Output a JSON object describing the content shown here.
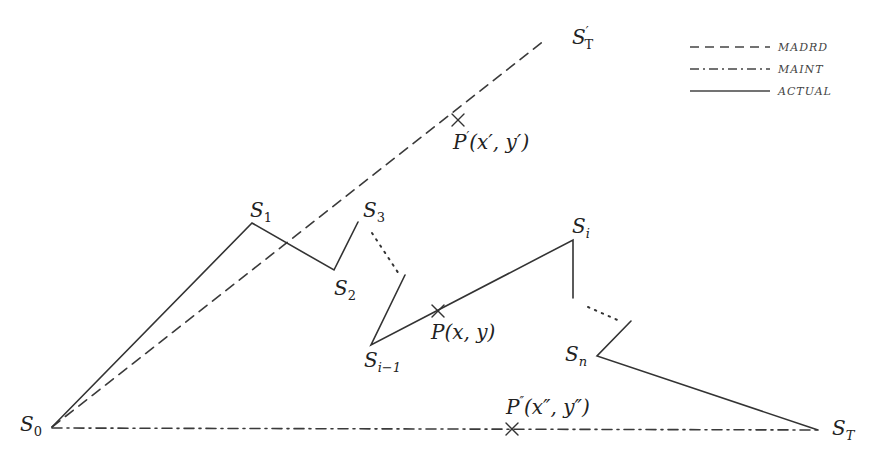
{
  "figure": {
    "type": "path-deviation-diagram",
    "background": "#ffffff",
    "line_color": "#333333"
  },
  "legend": {
    "items": [
      {
        "style": "dashed",
        "label": "MADRD"
      },
      {
        "style": "dash-dot",
        "label": "MAINT"
      },
      {
        "style": "solid",
        "label": "ACTUAL"
      }
    ]
  },
  "nodes": {
    "S0": {
      "base": "S",
      "sub": "0",
      "x": 52,
      "y": 427
    },
    "S1": {
      "base": "S",
      "sub": "1",
      "x": 252,
      "y": 223
    },
    "S2": {
      "base": "S",
      "sub": "2",
      "x": 334,
      "y": 270
    },
    "S3": {
      "base": "S",
      "sub": "3",
      "x": 358,
      "y": 222
    },
    "Si_1": {
      "base": "S",
      "sub": "i−1",
      "x": 371,
      "y": 345
    },
    "Si": {
      "base": "S",
      "sub": "i",
      "x": 573,
      "y": 240
    },
    "Sn": {
      "base": "S",
      "sub": "n",
      "x": 597,
      "y": 356
    },
    "ST": {
      "base": "S",
      "sub": "T",
      "x": 818,
      "y": 430
    },
    "STp": {
      "base": "S",
      "prime": "′",
      "sub": "T",
      "x": 545,
      "y": 40
    }
  },
  "points": {
    "P": {
      "label": "P(x, y)",
      "base": "P",
      "args": "(x, y)",
      "x": 438,
      "y": 311
    },
    "Pp": {
      "label": "P′(x′, y′)",
      "base": "P",
      "prime": "′",
      "args": "(x′, y′)",
      "x": 458,
      "y": 120
    },
    "Ppp": {
      "label": "P″(x″, y″)",
      "base": "P",
      "prime": "″",
      "args": "(x″, y″)",
      "x": 512,
      "y": 429
    }
  },
  "paths": {
    "actual": [
      "S0",
      "S1",
      "S2",
      "S3",
      "…",
      "Si_1",
      "Si",
      "…",
      "Sn",
      "ST"
    ],
    "madrd": [
      "S0",
      "STp"
    ],
    "maint": [
      "S0",
      "ST"
    ]
  }
}
